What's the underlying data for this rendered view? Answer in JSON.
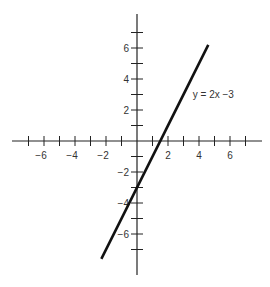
{
  "chart_data": {
    "type": "line",
    "title": "",
    "xlabel": "",
    "ylabel": "",
    "xlim": [
      -8,
      8
    ],
    "ylim": [
      -8.5,
      8.3
    ],
    "grid": false,
    "x_ticks": [
      -7,
      -6,
      -5,
      -4,
      -3,
      -2,
      -1,
      1,
      2,
      3,
      4,
      5,
      6,
      7
    ],
    "y_ticks": [
      -7,
      -6,
      -5,
      -4,
      -3,
      -2,
      -1,
      1,
      2,
      3,
      4,
      5,
      6,
      7
    ],
    "x_tick_labels": [
      {
        "value": -6,
        "text": "−6"
      },
      {
        "value": -4,
        "text": "−4"
      },
      {
        "value": -2,
        "text": "−2"
      },
      {
        "value": 2,
        "text": "2"
      },
      {
        "value": 4,
        "text": "4"
      },
      {
        "value": 6,
        "text": "6"
      }
    ],
    "y_tick_labels": [
      {
        "value": 6,
        "text": "6"
      },
      {
        "value": 4,
        "text": "4"
      },
      {
        "value": 2,
        "text": "2"
      },
      {
        "value": -2,
        "text": "−2"
      },
      {
        "value": -4,
        "text": "−4"
      },
      {
        "value": -6,
        "text": "−6"
      }
    ],
    "series": [
      {
        "name": "y = 2x − 3",
        "equation": "y = 2x - 3",
        "color": "#111111",
        "x": [
          -2.3,
          4.6
        ],
        "y": [
          -7.6,
          6.2
        ]
      }
    ],
    "annotations": [
      {
        "text": "y = 2x −3",
        "x": 3.6,
        "y": 3
      }
    ]
  },
  "style": {
    "axis_color": "#222222",
    "line_color": "#111111"
  }
}
